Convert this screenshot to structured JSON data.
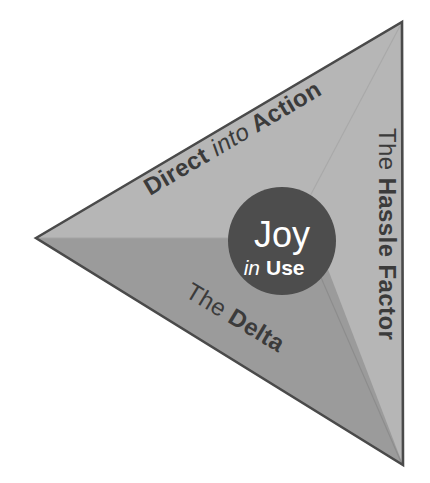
{
  "diagram": {
    "core": {
      "name": "joy-in-use-core",
      "line1": "Joy",
      "line2_italic": "in",
      "line2_bold": "Use",
      "fill_color": "#4d4d4d",
      "text_color": "#ffffff"
    },
    "segments": [
      {
        "name": "direct-into-action",
        "part1_bold": "Direct",
        "part2_italic": "into",
        "part3_bold": "Action",
        "full_label": "Direct into Action",
        "fill_color": "#b6b6b6",
        "text_color": "#3b3b3b"
      },
      {
        "name": "the-hassle-factor",
        "part1_regular": "The",
        "part2_bold": "Hassle Factor",
        "full_label": "The Hassle Factor",
        "fill_color": "#b6b6b6",
        "text_color": "#3b3b3b"
      },
      {
        "name": "the-delta",
        "part1_regular": "The",
        "part2_bold": "Delta",
        "full_label": "The Delta",
        "fill_color": "#9b9b9b",
        "text_color": "#3b3b3b"
      }
    ],
    "outline_color": "#4a4a4a",
    "background_color": "#ffffff"
  }
}
